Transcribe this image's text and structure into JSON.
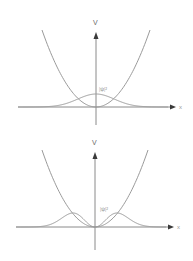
{
  "chart_data": [
    {
      "type": "line",
      "title": "",
      "xlabel": "x",
      "ylabel": "V",
      "grid": false,
      "series": [
        {
          "name": "V",
          "kind": "potential",
          "formula": "x^2"
        },
        {
          "name": "|ψ|²",
          "kind": "probability_density",
          "state": 0
        }
      ],
      "annotation": "|ψ|²"
    },
    {
      "type": "line",
      "title": "",
      "xlabel": "x",
      "ylabel": "V",
      "grid": false,
      "series": [
        {
          "name": "V",
          "kind": "potential",
          "formula": "x^2"
        },
        {
          "name": "|ψ|²",
          "kind": "probability_density",
          "state": 1
        }
      ],
      "annotation": "|ψ|²"
    }
  ]
}
